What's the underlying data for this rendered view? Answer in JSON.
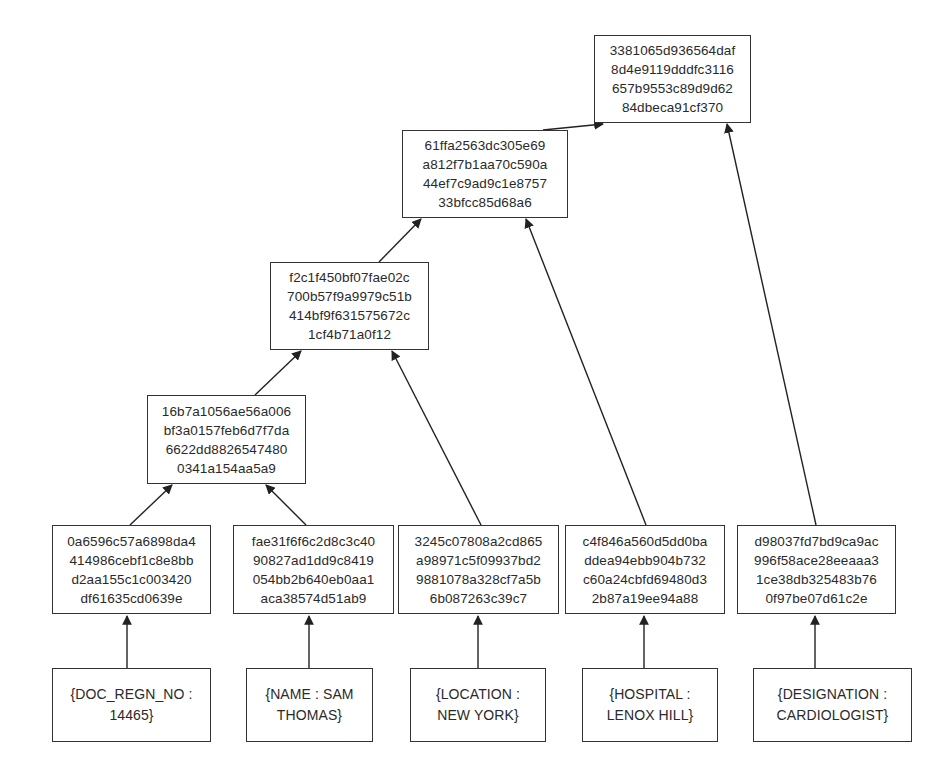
{
  "diagram": {
    "type": "merkle-tree",
    "root": {
      "lines": [
        "3381065d936564daf",
        "8d4e9119dddfc3116",
        "657b9553c89d9d62",
        "84dbeca91cf370"
      ]
    },
    "level3": {
      "lines": [
        "61ffa2563dc305e69",
        "a812f7b1aa70c590a",
        "44ef7c9ad9c1e8757",
        "33bfcc85d68a6"
      ]
    },
    "level2": {
      "lines": [
        "f2c1f450bf07fae02c",
        "700b57f9a9979c51b",
        "414bf9f631575672c",
        "1cf4b71a0f12"
      ]
    },
    "level1": {
      "lines": [
        "16b7a1056ae56a006",
        "bf3a0157feb6d7f7da",
        "6622dd8826547480",
        "0341a154aa5a9"
      ]
    },
    "leaf_hashes": [
      {
        "lines": [
          "0a6596c57a6898da4",
          "414986cebf1c8e8bb",
          "d2aa155c1c003420",
          "df61635cd0639e"
        ]
      },
      {
        "lines": [
          "fae31f6f6c2d8c3c40",
          "90827ad1dd9c8419",
          "054bb2b640eb0aa1",
          "aca38574d51ab9"
        ]
      },
      {
        "lines": [
          "3245c07808a2cd865",
          "a98971c5f09937bd2",
          "9881078a328cf7a5b",
          "6b087263c39c7"
        ]
      },
      {
        "lines": [
          "c4f846a560d5dd0ba",
          "ddea94ebb904b732",
          "c60a24cbfd69480d3",
          "2b87a19ee94a88"
        ]
      },
      {
        "lines": [
          "d98037fd7bd9ca9ac",
          "996f58ace28eeaaa3",
          "1ce38db325483b76",
          "0f97be07d61c2e"
        ]
      }
    ],
    "data_blocks": [
      {
        "lines": [
          "{DOC_REGN_NO :",
          "14465}"
        ]
      },
      {
        "lines": [
          "{NAME : SAM",
          "THOMAS}"
        ]
      },
      {
        "lines": [
          "{LOCATION :",
          "NEW YORK}"
        ]
      },
      {
        "lines": [
          "{HOSPITAL :",
          "LENOX HILL}"
        ]
      },
      {
        "lines": [
          "{DESIGNATION :",
          "CARDIOLOGIST}"
        ]
      }
    ]
  }
}
